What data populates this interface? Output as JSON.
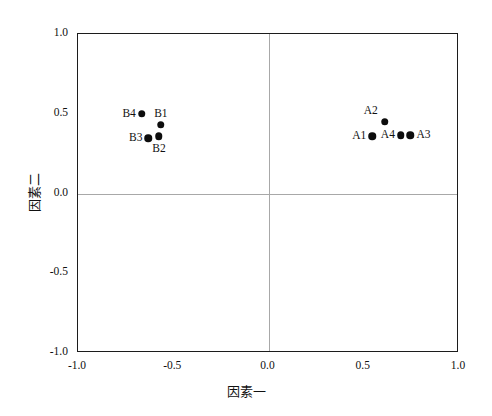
{
  "chart_data": {
    "type": "scatter",
    "title": "",
    "xlabel": "因素一",
    "ylabel": "因素二",
    "xlim": [
      -1.0,
      1.0
    ],
    "ylim": [
      -1.0,
      1.0
    ],
    "xticks": [
      "-1.0",
      "-0.5",
      "0.0",
      "0.5",
      "1.0"
    ],
    "xtick_values": [
      -1.0,
      -0.5,
      0.0,
      0.5,
      1.0
    ],
    "yticks": [
      "-1.0",
      "-0.5",
      "0.0",
      "0.5",
      "1.0"
    ],
    "ytick_values": [
      -1.0,
      -0.5,
      0.0,
      0.5,
      1.0
    ],
    "grid": false,
    "reference_lines": {
      "horizontal": 0.0,
      "vertical": 0.0
    },
    "legend": null,
    "marker": {
      "shape": "circle",
      "color": "#0d0d0d",
      "size": 7.5
    },
    "points": [
      {
        "label": "B4",
        "x": -0.665,
        "y": 0.5,
        "label_position": "left"
      },
      {
        "label": "B1",
        "x": -0.565,
        "y": 0.43,
        "label_position": "above"
      },
      {
        "label": "B3",
        "x": -0.63,
        "y": 0.345,
        "label_position": "left"
      },
      {
        "label": "B2",
        "x": -0.575,
        "y": 0.36,
        "label_position": "below"
      },
      {
        "label": "A2",
        "x": 0.61,
        "y": 0.45,
        "label_position": "above-left"
      },
      {
        "label": "A1",
        "x": 0.545,
        "y": 0.36,
        "label_position": "left"
      },
      {
        "label": "A4",
        "x": 0.695,
        "y": 0.365,
        "label_position": "left"
      },
      {
        "label": "A3",
        "x": 0.745,
        "y": 0.365,
        "label_position": "right"
      }
    ]
  },
  "colors": {
    "frame": "#1c1c1c",
    "reference_line": "#a8a8a8",
    "marker": "#0d0d0d",
    "text": "#111111",
    "background": "#ffffff"
  }
}
